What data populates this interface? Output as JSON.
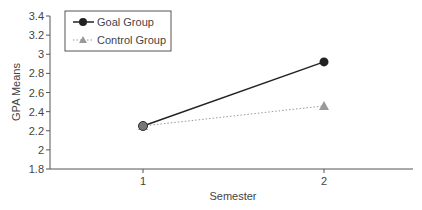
{
  "chart_data": {
    "type": "line",
    "title": "",
    "xlabel": "Semester",
    "ylabel": "GPA Means",
    "categories": [
      "1",
      "2"
    ],
    "series": [
      {
        "name": "Goal Group",
        "values": [
          2.25,
          2.92
        ],
        "color": "#222222",
        "style": "solid",
        "marker": "circle"
      },
      {
        "name": "Control Group",
        "values": [
          2.25,
          2.46
        ],
        "color": "#999999",
        "style": "dotted",
        "marker": "triangle"
      }
    ],
    "ylim": [
      1.8,
      3.4
    ],
    "yticks": [
      "1.8",
      "2",
      "2.2",
      "2.4",
      "2.6",
      "2.8",
      "3",
      "3.2",
      "3.4"
    ],
    "grid": false,
    "legend_position": "top-left"
  }
}
